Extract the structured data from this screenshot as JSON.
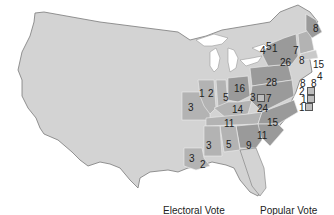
{
  "legend": {
    "electoral_vote_label": "Electoral Vote",
    "popular_vote_label": "Popular Vote"
  },
  "colors": {
    "unorganized": "#d3d3d3",
    "dark": "#9a9a9a",
    "medium": "#b3b3b3",
    "light": "#c9c9c9",
    "border": "#7a7a7a"
  },
  "states": [
    {
      "id": "ME",
      "votes": "8"
    },
    {
      "id": "NH",
      "votes": "8"
    },
    {
      "id": "VT",
      "votes": "7"
    },
    {
      "id": "MA",
      "votes": "15"
    },
    {
      "id": "RI",
      "votes": "4"
    },
    {
      "id": "CT",
      "votes": "8"
    },
    {
      "id": "NY",
      "votes": "26"
    },
    {
      "id": "NY-split-a",
      "votes": "4"
    },
    {
      "id": "NY-split-b",
      "votes": "5"
    },
    {
      "id": "NY-split-c",
      "votes": "1"
    },
    {
      "id": "NJ",
      "votes": "8"
    },
    {
      "id": "DE",
      "votes": "2"
    },
    {
      "id": "MD-a",
      "votes": "1"
    },
    {
      "id": "MD-b",
      "votes": "1"
    },
    {
      "id": "PA",
      "votes": "28"
    },
    {
      "id": "OH",
      "votes": "16"
    },
    {
      "id": "MD-west",
      "votes": "3"
    },
    {
      "id": "MD-east",
      "votes": "7"
    },
    {
      "id": "VA",
      "votes": "24"
    },
    {
      "id": "NC",
      "votes": "15"
    },
    {
      "id": "SC",
      "votes": "11"
    },
    {
      "id": "GA",
      "votes": "9"
    },
    {
      "id": "AL",
      "votes": "5"
    },
    {
      "id": "MS",
      "votes": "3"
    },
    {
      "id": "LA-a",
      "votes": "3"
    },
    {
      "id": "LA-b",
      "votes": "2"
    },
    {
      "id": "TN",
      "votes": "11"
    },
    {
      "id": "KY",
      "votes": "14"
    },
    {
      "id": "IN",
      "votes": "5"
    },
    {
      "id": "IL-a",
      "votes": "1"
    },
    {
      "id": "IL-b",
      "votes": "2"
    },
    {
      "id": "MO",
      "votes": "3"
    }
  ]
}
